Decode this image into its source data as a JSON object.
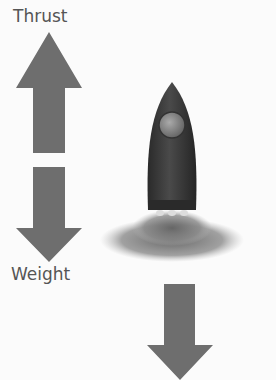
{
  "labels": {
    "thrust": "Thrust",
    "weight": "Weight"
  },
  "colors": {
    "arrow": "#6e6e6e",
    "rocket_body": "#3a3a3a",
    "window": "#8a8a8a",
    "exhaust": "#7a7a7a"
  }
}
